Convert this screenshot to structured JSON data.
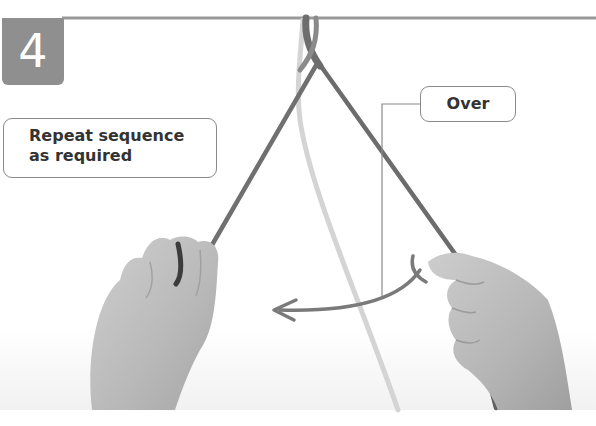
{
  "step": {
    "number": "4"
  },
  "labels": {
    "repeat": {
      "line1": "Repeat sequence",
      "line2": "as required"
    },
    "over": "Over"
  },
  "colors": {
    "badge": "#8f8f8f",
    "rope_dark": "#6e6e6e",
    "rope_light": "#d4d4d4",
    "arrow": "#7a7a7a",
    "label_border": "#8a8a8a",
    "label_text": "#333333",
    "bar": "#9a9a9a"
  }
}
